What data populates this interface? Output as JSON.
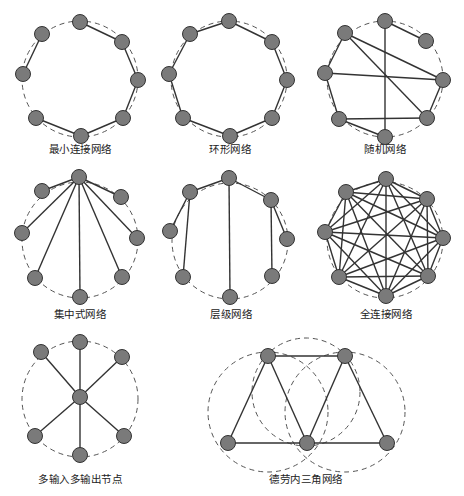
{
  "diagrams": [
    {
      "id": "min-connected",
      "label": "最小连接网络",
      "label_pos": [
        80,
        147
      ],
      "rings": [
        {
          "cx": 80,
          "cy": 79,
          "r": 58
        }
      ],
      "nodes": [
        [
          80,
          22
        ],
        [
          42,
          34
        ],
        [
          23,
          74
        ],
        [
          36,
          118
        ],
        [
          81,
          136
        ],
        [
          123,
          118
        ],
        [
          138,
          80
        ],
        [
          122,
          42
        ]
      ],
      "edges": [
        [
          0,
          7
        ],
        [
          7,
          6
        ],
        [
          6,
          5
        ],
        [
          5,
          4
        ],
        [
          4,
          3
        ],
        [
          1,
          2
        ]
      ]
    },
    {
      "id": "ring",
      "label": "环形网络",
      "label_pos": [
        230,
        147
      ],
      "rings": [
        {
          "cx": 229,
          "cy": 79,
          "r": 58
        }
      ],
      "nodes": [
        [
          229,
          21
        ],
        [
          190,
          34
        ],
        [
          169,
          74
        ],
        [
          183,
          118
        ],
        [
          230,
          136
        ],
        [
          272,
          118
        ],
        [
          287,
          80
        ],
        [
          272,
          42
        ]
      ],
      "edges": [
        [
          0,
          1
        ],
        [
          1,
          2
        ],
        [
          2,
          3
        ],
        [
          3,
          4
        ],
        [
          4,
          5
        ],
        [
          5,
          6
        ],
        [
          6,
          7
        ],
        [
          7,
          0
        ]
      ]
    },
    {
      "id": "random",
      "label": "随机网络",
      "label_pos": [
        385,
        147
      ],
      "rings": [
        {
          "cx": 385,
          "cy": 79,
          "r": 58
        }
      ],
      "nodes": [
        [
          385,
          21
        ],
        [
          345,
          33
        ],
        [
          325,
          73
        ],
        [
          339,
          119
        ],
        [
          385,
          137
        ],
        [
          427,
          118
        ],
        [
          443,
          80
        ],
        [
          426,
          41
        ]
      ],
      "edges": [
        [
          0,
          7
        ],
        [
          0,
          4
        ],
        [
          1,
          2
        ],
        [
          1,
          6
        ],
        [
          1,
          5
        ],
        [
          2,
          6
        ],
        [
          2,
          3
        ],
        [
          3,
          5
        ],
        [
          3,
          4
        ],
        [
          5,
          6
        ]
      ]
    },
    {
      "id": "centralized",
      "label": "集中式网络",
      "label_pos": [
        80,
        312
      ],
      "rings": [
        {
          "cx": 80,
          "cy": 240,
          "r": 58
        }
      ],
      "nodes": [
        [
          79,
          177
        ],
        [
          42,
          191
        ],
        [
          22,
          233
        ],
        [
          35,
          278
        ],
        [
          80,
          297
        ],
        [
          122,
          277
        ],
        [
          137,
          238
        ],
        [
          121,
          197
        ]
      ],
      "edges": [
        [
          0,
          1
        ],
        [
          0,
          2
        ],
        [
          0,
          3
        ],
        [
          0,
          4
        ],
        [
          0,
          5
        ],
        [
          0,
          6
        ],
        [
          0,
          7
        ]
      ]
    },
    {
      "id": "hierarchical",
      "label": "层级网络",
      "label_pos": [
        231,
        312
      ],
      "rings": [
        {
          "cx": 230,
          "cy": 241,
          "r": 58
        }
      ],
      "nodes": [
        [
          229,
          178
        ],
        [
          190,
          192
        ],
        [
          170,
          231
        ],
        [
          183,
          277
        ],
        [
          230,
          297
        ],
        [
          272,
          276
        ],
        [
          287,
          239
        ],
        [
          271,
          200
        ]
      ],
      "edges": [
        [
          0,
          1
        ],
        [
          0,
          7
        ],
        [
          0,
          4
        ],
        [
          1,
          2
        ],
        [
          1,
          3
        ],
        [
          7,
          6
        ],
        [
          7,
          5
        ]
      ]
    },
    {
      "id": "fully-connected",
      "label": "全连接网络",
      "label_pos": [
        386,
        312
      ],
      "rings": [
        {
          "cx": 385,
          "cy": 240,
          "r": 58
        }
      ],
      "nodes": [
        [
          386,
          179
        ],
        [
          346,
          192
        ],
        [
          325,
          232
        ],
        [
          339,
          277
        ],
        [
          386,
          296
        ],
        [
          428,
          276
        ],
        [
          443,
          238
        ],
        [
          427,
          199
        ]
      ],
      "edges": "all"
    },
    {
      "id": "mimo-node",
      "label": "多输入多输出节点",
      "label_pos": [
        80,
        477
      ],
      "rings": [
        {
          "cx": 80,
          "cy": 399,
          "r": 58
        }
      ],
      "nodes": [
        [
          80,
          397
        ],
        [
          80,
          342
        ],
        [
          41,
          352
        ],
        [
          122,
          357
        ],
        [
          35,
          436
        ],
        [
          124,
          436
        ],
        [
          80,
          455
        ]
      ],
      "edges": [
        [
          0,
          1
        ],
        [
          0,
          2
        ],
        [
          0,
          3
        ],
        [
          0,
          4
        ],
        [
          0,
          5
        ],
        [
          0,
          6
        ]
      ]
    },
    {
      "id": "delaunay",
      "label": "德劳内三角网络",
      "label_pos": [
        306,
        477
      ],
      "rings": [
        {
          "cx": 268,
          "cy": 412,
          "r": 60
        },
        {
          "cx": 306,
          "cy": 392,
          "r": 54
        },
        {
          "cx": 345,
          "cy": 412,
          "r": 60
        }
      ],
      "nodes": [
        [
          268,
          356
        ],
        [
          345,
          356
        ],
        [
          228,
          443
        ],
        [
          307,
          443
        ],
        [
          387,
          443
        ]
      ],
      "edges": [
        [
          0,
          1
        ],
        [
          0,
          2
        ],
        [
          0,
          3
        ],
        [
          1,
          3
        ],
        [
          1,
          4
        ],
        [
          2,
          3
        ],
        [
          3,
          4
        ]
      ]
    }
  ]
}
